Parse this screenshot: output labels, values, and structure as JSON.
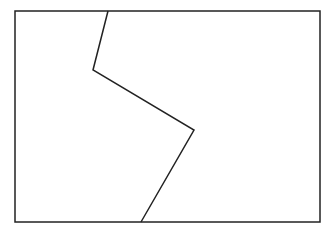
{
  "canvas": {
    "width": 336,
    "height": 234,
    "background": "#ffffff"
  },
  "diagram": {
    "stroke_color": "#222222",
    "stroke_width": 1.5,
    "frame": {
      "x": 15,
      "y": 11,
      "width": 305,
      "height": 211
    },
    "divider_polyline": [
      [
        108,
        11
      ],
      [
        93,
        70
      ],
      [
        194,
        130
      ],
      [
        141,
        222
      ]
    ]
  }
}
